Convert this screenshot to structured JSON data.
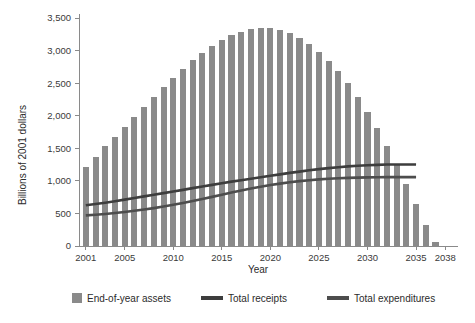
{
  "chart_data": {
    "type": "bar",
    "title": "",
    "xlabel": "Year",
    "ylabel": "Billions of 2001 dollars",
    "xlim": [
      2000.3,
      2038.7
    ],
    "ylim": [
      0,
      3500
    ],
    "grid": false,
    "legend_position": "bottom",
    "y_ticks": [
      0,
      500,
      1000,
      1500,
      2000,
      2500,
      3000,
      3500
    ],
    "y_tick_labels": [
      "0",
      "500",
      "1,000",
      "1,500",
      "2,000",
      "2,500",
      "3,000",
      "3,500"
    ],
    "x_ticks": [
      2001,
      2005,
      2010,
      2015,
      2020,
      2025,
      2030,
      2035,
      2038
    ],
    "x_tick_labels": [
      "2001",
      "2005",
      "2010",
      "2015",
      "2020",
      "2025",
      "2030",
      "2035",
      "2038"
    ],
    "x": [
      2001,
      2002,
      2003,
      2004,
      2005,
      2006,
      2007,
      2008,
      2009,
      2010,
      2011,
      2012,
      2013,
      2014,
      2015,
      2016,
      2017,
      2018,
      2019,
      2020,
      2021,
      2022,
      2023,
      2024,
      2025,
      2026,
      2027,
      2028,
      2029,
      2030,
      2031,
      2032,
      2033,
      2034,
      2035,
      2036,
      2037,
      2038
    ],
    "series": [
      {
        "name": "End-of-year assets",
        "type": "bar",
        "color": "#8a8a8a",
        "values": [
          1210,
          1360,
          1530,
          1680,
          1820,
          1975,
          2130,
          2280,
          2440,
          2580,
          2710,
          2855,
          2965,
          3065,
          3165,
          3240,
          3290,
          3330,
          3350,
          3345,
          3320,
          3270,
          3195,
          3100,
          2985,
          2845,
          2685,
          2500,
          2290,
          2060,
          1810,
          1540,
          1250,
          950,
          640,
          320,
          60,
          0
        ]
      },
      {
        "name": "Total receipts",
        "type": "line",
        "color": "#3d3d3d",
        "values": [
          625,
          645,
          665,
          688,
          712,
          737,
          762,
          788,
          812,
          838,
          862,
          888,
          912,
          938,
          962,
          988,
          1010,
          1032,
          1055,
          1078,
          1100,
          1122,
          1142,
          1162,
          1180,
          1196,
          1210,
          1222,
          1232,
          1240,
          1246,
          1250,
          1252,
          1252,
          1250,
          null,
          null,
          null
        ]
      },
      {
        "name": "Total expenditures",
        "type": "line",
        "color": "#4d4d4d",
        "values": [
          470,
          480,
          492,
          506,
          522,
          540,
          560,
          582,
          606,
          632,
          660,
          690,
          722,
          754,
          788,
          820,
          852,
          882,
          910,
          936,
          958,
          978,
          996,
          1010,
          1022,
          1032,
          1040,
          1046,
          1050,
          1054,
          1056,
          1058,
          1058,
          1058,
          1058,
          null,
          null,
          null
        ]
      }
    ]
  },
  "legend": {
    "items": [
      {
        "label": "End-of-year assets",
        "marker": "square",
        "color": "#8a8a8a"
      },
      {
        "label": "Total receipts",
        "marker": "line",
        "color": "#3d3d3d"
      },
      {
        "label": "Total expenditures",
        "marker": "line",
        "color": "#4d4d4d"
      }
    ]
  }
}
